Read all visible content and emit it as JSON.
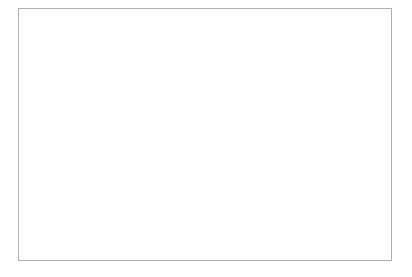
{
  "chart_data": {
    "type": "line",
    "title": "",
    "xlabel": "",
    "ylabel": "",
    "ylim": [
      0,
      30
    ],
    "ytick_labels": [
      "0.0%",
      "5.0%",
      "10.0%",
      "15.0%",
      "20.0%",
      "25.0%",
      "30.0%"
    ],
    "ytick_values": [
      0,
      5,
      10,
      15,
      20,
      25,
      30
    ],
    "grid": true,
    "legend_position": "center-right",
    "categories": [
      "1970-71",
      "1975-76",
      "1980-81",
      "1985-86",
      "1990-91",
      "1995-96",
      "1996-97",
      "1997-98",
      "1998-99",
      "1999-2000",
      "2000-01",
      "2001-02",
      "2002-03",
      "2003-04",
      "2004-05",
      "2005-06",
      "2006-07"
    ],
    "series": [
      {
        "name": "Undergraduate",
        "style": "dashed",
        "color": "#111111",
        "values": [
          13.9,
          14.9,
          18.5,
          23.4,
          23.2,
          19.3,
          19.4,
          19.8,
          20.1,
          20.6,
          21.0,
          21.3,
          21.5,
          21.8,
          21.6,
          21.3,
          21.2
        ]
      },
      {
        "name": "Masters",
        "style": "solid",
        "color": "#111111",
        "values": [
          11.5,
          13.3,
          17.1,
          22.3,
          23.4,
          22.9,
          23.1,
          23.5,
          24.2,
          24.4,
          24.4,
          24.4,
          24.4,
          24.5,
          24.5,
          24.4,
          24.6
        ]
      }
    ]
  },
  "legend": {
    "items": [
      {
        "label": "Undergraduate"
      },
      {
        "label": "Masters"
      }
    ]
  }
}
